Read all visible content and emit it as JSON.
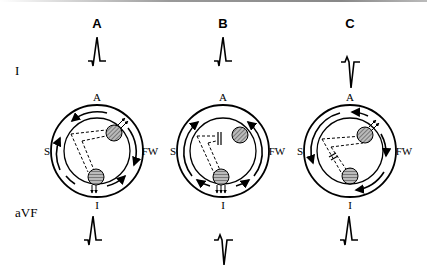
{
  "columns": [
    {
      "label": "A",
      "lead_I": "positive",
      "lead_aVF": "positive"
    },
    {
      "label": "B",
      "lead_I": "positive",
      "lead_aVF": "negative"
    },
    {
      "label": "C",
      "lead_I": "negative",
      "lead_aVF": "positive"
    }
  ],
  "leads": {
    "top": "I",
    "bottom": "aVF"
  },
  "directions": {
    "anterior": "A",
    "inferior": "I",
    "septal": "S",
    "free_wall": "FW"
  }
}
